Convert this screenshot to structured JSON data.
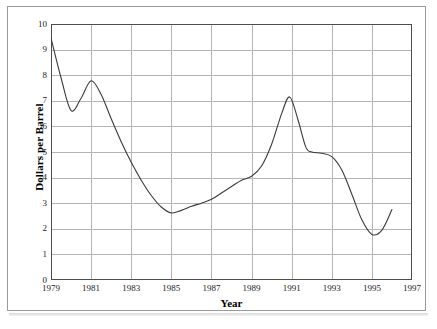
{
  "figure": {
    "background_color": "#ffffff",
    "frame_color": "#9a9a9a",
    "axis_color": "#4d4d4d",
    "grid_color": "#b5b5b5",
    "line_color": "#3a3a3a"
  },
  "axes": {
    "x_title": "Year",
    "y_title": "Dollars per Barrel"
  },
  "chart_data": {
    "type": "line",
    "title": "",
    "subtitle": "",
    "xlabel": "Year",
    "ylabel": "Dollars per Barrel",
    "xlim": [
      1979,
      1997
    ],
    "ylim": [
      0,
      10
    ],
    "grid": true,
    "legend": false,
    "legend_position": "none",
    "x_ticks": [
      1979,
      1981,
      1983,
      1985,
      1987,
      1989,
      1991,
      1993,
      1995,
      1997
    ],
    "x_tick_labels": [
      "1979",
      "1981",
      "1983",
      "1985",
      "1987",
      "1989",
      "1991",
      "1993",
      "1995",
      "1997"
    ],
    "y_ticks": [
      0,
      1,
      2,
      3,
      4,
      5,
      6,
      7,
      8,
      9,
      10
    ],
    "y_tick_labels": [
      "0",
      "1",
      "2",
      "3",
      "4",
      "5",
      "6",
      "7",
      "8",
      "9",
      "10"
    ],
    "x": [
      1979.0,
      1979.5,
      1980.0,
      1980.5,
      1981.0,
      1981.5,
      1982.0,
      1982.5,
      1983.0,
      1983.5,
      1984.0,
      1984.5,
      1985.0,
      1985.5,
      1986.0,
      1986.5,
      1987.0,
      1987.5,
      1988.0,
      1988.5,
      1989.0,
      1989.5,
      1990.0,
      1990.5,
      1990.9,
      1991.3,
      1991.7,
      1992.0,
      1992.5,
      1993.0,
      1993.5,
      1994.0,
      1994.5,
      1995.0,
      1995.5,
      1996.0
    ],
    "y": [
      9.45,
      7.9,
      6.62,
      7.1,
      7.78,
      7.25,
      6.3,
      5.4,
      4.6,
      3.9,
      3.3,
      2.85,
      2.62,
      2.72,
      2.88,
      3.0,
      3.15,
      3.4,
      3.65,
      3.9,
      4.05,
      4.45,
      5.3,
      6.5,
      7.15,
      6.3,
      5.2,
      5.0,
      4.95,
      4.82,
      4.3,
      3.35,
      2.35,
      1.78,
      1.95,
      2.75
    ],
    "series": [
      {
        "name": "Dollars per Barrel",
        "values": [
          9.45,
          7.9,
          6.62,
          7.1,
          7.78,
          7.25,
          6.3,
          5.4,
          4.6,
          3.9,
          3.3,
          2.85,
          2.62,
          2.72,
          2.88,
          3.0,
          3.15,
          3.4,
          3.65,
          3.9,
          4.05,
          4.45,
          5.3,
          6.5,
          7.15,
          6.3,
          5.2,
          5.0,
          4.95,
          4.82,
          4.3,
          3.35,
          2.35,
          1.78,
          1.95,
          2.75
        ]
      }
    ],
    "annotations": []
  }
}
